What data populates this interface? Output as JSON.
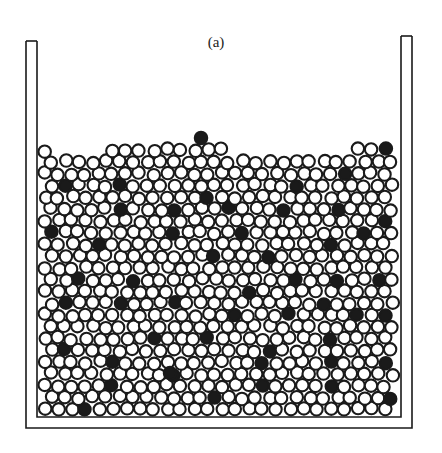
{
  "figure": {
    "panel_label": "(a)",
    "colors": {
      "outline": "#1a1a1a",
      "white_particle": "#ffffff",
      "black_particle": "#1a1a1a",
      "background": "#ffffff"
    },
    "container": {
      "left_wall": {
        "x": 26,
        "top": 41,
        "width": 11
      },
      "right_wall": {
        "x": 401,
        "top": 36,
        "width": 11
      },
      "bottom_outer_y": 428,
      "floor_inner_y": 417
    },
    "particles": {
      "radius": 6.2,
      "spacing": 13.6,
      "fill_top_y": 150,
      "region": {
        "x0": 38,
        "x1": 401,
        "y1": 416
      },
      "black_positions": [
        [
          201,
          138
        ],
        [
          383,
          139
        ],
        [
          65,
          182
        ],
        [
          117,
          180
        ],
        [
          209,
          194
        ],
        [
          295,
          181
        ],
        [
          347,
          180
        ],
        [
          119,
          204
        ],
        [
          173,
          203
        ],
        [
          227,
          210
        ],
        [
          290,
          213
        ],
        [
          342,
          207
        ],
        [
          386,
          219
        ],
        [
          49,
          226
        ],
        [
          98,
          240
        ],
        [
          167,
          236
        ],
        [
          244,
          238
        ],
        [
          331,
          241
        ],
        [
          367,
          235
        ],
        [
          213,
          260
        ],
        [
          270,
          263
        ],
        [
          72,
          276
        ],
        [
          136,
          278
        ],
        [
          296,
          281
        ],
        [
          378,
          275
        ],
        [
          339,
          283
        ],
        [
          256,
          294
        ],
        [
          119,
          300
        ],
        [
          175,
          305
        ],
        [
          234,
          309
        ],
        [
          64,
          304
        ],
        [
          292,
          320
        ],
        [
          357,
          315
        ],
        [
          318,
          305
        ],
        [
          379,
          317
        ],
        [
          209,
          343
        ],
        [
          270,
          344
        ],
        [
          62,
          347
        ],
        [
          148,
          341
        ],
        [
          331,
          344
        ],
        [
          117,
          363
        ],
        [
          180,
          378
        ],
        [
          260,
          381
        ],
        [
          379,
          366
        ],
        [
          335,
          366
        ],
        [
          89,
          405
        ],
        [
          117,
          383
        ],
        [
          215,
          405
        ],
        [
          335,
          389
        ],
        [
          398,
          403
        ],
        [
          170,
          373
        ],
        [
          261,
          364
        ]
      ]
    }
  }
}
